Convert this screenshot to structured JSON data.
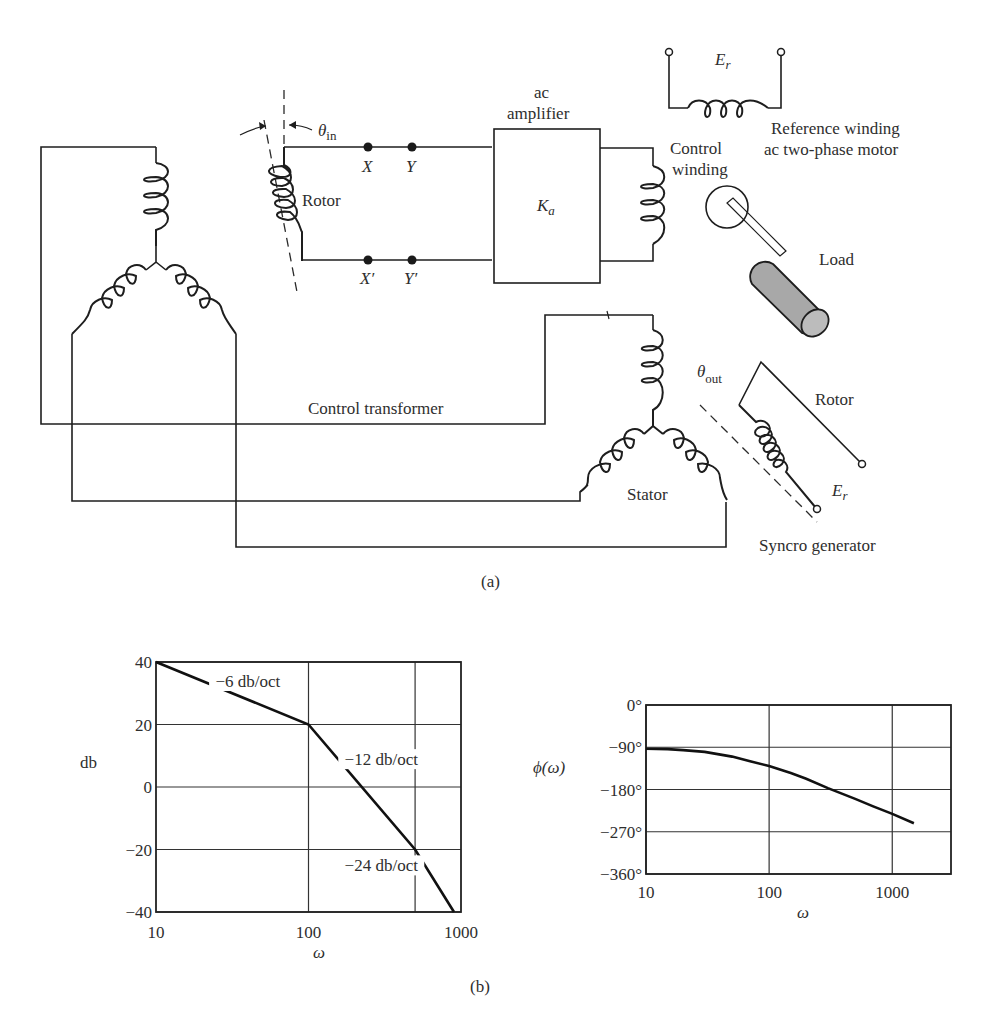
{
  "part_a": {
    "caption": "(a)",
    "labels": {
      "theta_in": "θ",
      "theta_in_sub": "in",
      "rotor_left": "Rotor",
      "node_x": "X",
      "node_y": "Y",
      "node_x_prime": "X′",
      "node_y_prime": "Y′",
      "amp_line1": "ac",
      "amp_line2": "amplifier",
      "amp_gain": "K",
      "amp_gain_sub": "a",
      "er_top": "E",
      "er_top_sub": "r",
      "ref_line1": "Reference winding",
      "ref_line2": "ac two-phase motor",
      "ctrl_line1": "Control",
      "ctrl_line2": "winding",
      "load": "Load",
      "control_transformer": "Control transformer",
      "theta_out": "θ",
      "theta_out_sub": "out",
      "rotor_right": "Rotor",
      "er_bottom": "E",
      "er_bottom_sub": "r",
      "stator": "Stator",
      "syncro_generator": "Syncro generator"
    },
    "load_color": "#a8a8a8"
  },
  "part_b": {
    "caption": "(b)"
  },
  "chart_data": [
    {
      "type": "line",
      "title": "",
      "xlabel": "ω",
      "ylabel": "db",
      "xscale": "log",
      "xlim": [
        10,
        1000
      ],
      "ylim": [
        -40,
        40
      ],
      "xticks": [
        10,
        100,
        1000
      ],
      "xtick_labels": [
        "10",
        "100",
        "1000"
      ],
      "xgrid": [
        100,
        500
      ],
      "yticks": [
        40,
        20,
        0,
        -20,
        -40
      ],
      "ytick_labels": [
        "40",
        "20",
        "0",
        "−20",
        "−40"
      ],
      "grid": true,
      "series": [
        {
          "name": "magnitude",
          "x": [
            10,
            100,
            500,
            900
          ],
          "y": [
            40,
            20,
            -20,
            -40
          ]
        }
      ],
      "annotations": [
        {
          "text": "−6 db/oct",
          "x": 40,
          "y": 32
        },
        {
          "text": "−12 db/oct",
          "x": 300,
          "y": 7
        },
        {
          "text": "−24 db/oct",
          "x": 300,
          "y": -27
        }
      ]
    },
    {
      "type": "line",
      "title": "",
      "xlabel": "ω",
      "ylabel": "ϕ(ω)",
      "xscale": "log",
      "xlim": [
        10,
        3000
      ],
      "ylim": [
        -360,
        0
      ],
      "xticks": [
        10,
        100,
        1000
      ],
      "xtick_labels": [
        "10",
        "100",
        "1000"
      ],
      "yticks": [
        0,
        -90,
        -180,
        -270,
        -360
      ],
      "ytick_labels": [
        "0°",
        "−90°",
        "−180°",
        "−270°",
        "−360°"
      ],
      "grid": true,
      "series": [
        {
          "name": "phase",
          "x": [
            10,
            15,
            20,
            30,
            50,
            70,
            100,
            150,
            200,
            300,
            500,
            700,
            1000,
            1500
          ],
          "y": [
            -93,
            -94,
            -96,
            -100,
            -110,
            -120,
            -130,
            -145,
            -157,
            -177,
            -200,
            -216,
            -232,
            -252
          ]
        }
      ]
    }
  ]
}
